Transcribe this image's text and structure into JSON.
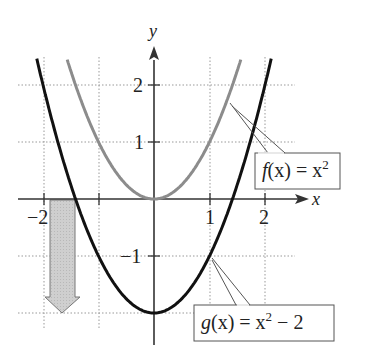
{
  "chart_data": {
    "type": "line",
    "title": "",
    "xlabel": "x",
    "ylabel": "y",
    "xlim": [
      -2.5,
      2.5
    ],
    "ylim": [
      -2.2,
      2.7
    ],
    "grid": true,
    "x_ticks": [
      -2,
      -1,
      1,
      2
    ],
    "x_tick_labels": [
      "-2",
      "",
      "1",
      "2"
    ],
    "y_ticks": [
      -2,
      -1,
      1,
      2
    ],
    "y_tick_labels": [
      "",
      "-1",
      "1",
      "2"
    ],
    "series": [
      {
        "name": "f(x) = x^2",
        "color": "#8c8c8c",
        "formula": "x^2",
        "x": [
          -1.6,
          -1.5,
          -1,
          -0.5,
          0,
          0.5,
          1,
          1.5,
          1.6
        ],
        "values": [
          2.56,
          2.25,
          1,
          0.25,
          0,
          0.25,
          1,
          2.25,
          2.56
        ]
      },
      {
        "name": "g(x) = x^2 - 2",
        "color": "#111111",
        "formula": "x^2 - 2",
        "x": [
          -2.1,
          -2,
          -1.5,
          -1,
          -0.5,
          0,
          0.5,
          1,
          1.5,
          2,
          2.1
        ],
        "values": [
          2.41,
          2,
          0.25,
          -1,
          -1.75,
          -2,
          -1.75,
          -1,
          0.25,
          2,
          2.41
        ]
      }
    ],
    "annotations": [
      {
        "type": "callout",
        "text": "f(x) = x²",
        "points_to": [
          1.35,
          1.82
        ]
      },
      {
        "type": "callout",
        "text": "g(x) = x² − 2",
        "points_to": [
          1,
          -1
        ]
      },
      {
        "type": "shift-arrow",
        "direction": "down",
        "from_y": 0,
        "to_y": -2,
        "x_range": [
          -1.9,
          -1.45
        ],
        "meaning": "vertical shift down 2 units"
      }
    ]
  },
  "labels": {
    "x_axis": "x",
    "y_axis": "y",
    "tick_x_neg2": "−2",
    "tick_x_1": "1",
    "tick_x_2": "2",
    "tick_y_2": "2",
    "tick_y_1": "1",
    "tick_y_neg1": "−1"
  },
  "callouts": {
    "f": {
      "fn": "f",
      "var": "(x) = x",
      "exp": "2",
      "rest": ""
    },
    "g": {
      "fn": "g",
      "var": "(x) = x",
      "exp": "2",
      "rest": " − 2"
    }
  }
}
